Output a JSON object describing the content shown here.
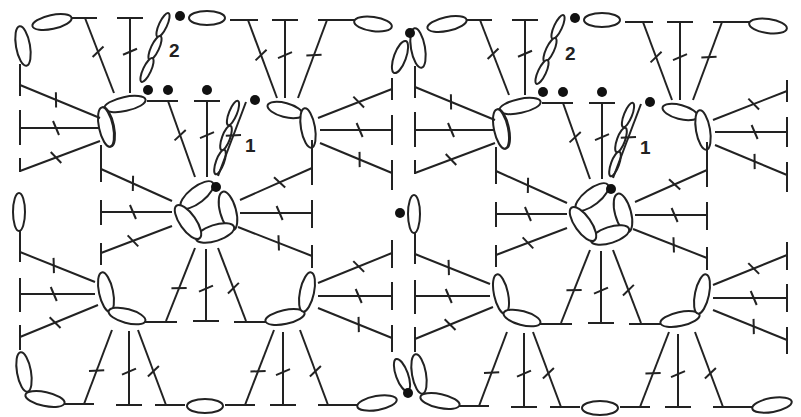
{
  "diagram": {
    "type": "crochet-chart",
    "motifs": [
      {
        "id": "left",
        "center": [
          205,
          213
        ],
        "round_labels": [
          {
            "text": "1",
            "x": 245,
            "y": 150
          },
          {
            "text": "2",
            "x": 170,
            "y": 55
          }
        ]
      },
      {
        "id": "right",
        "center": [
          600,
          215
        ],
        "round_labels": [
          {
            "text": "1",
            "x": 640,
            "y": 152
          },
          {
            "text": "2",
            "x": 565,
            "y": 60
          }
        ]
      }
    ],
    "legend_symbols": {
      "chain": "oval",
      "slip_stitch": "filled-dot",
      "double_crochet": "T-with-crossbar"
    },
    "colors": {
      "ink": "#222222",
      "background": "#ffffff"
    }
  }
}
